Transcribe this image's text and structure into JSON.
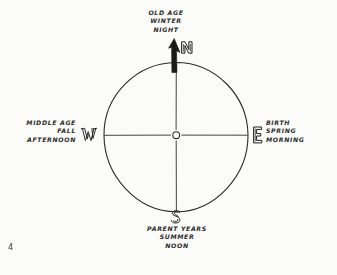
{
  "figure": {
    "kind": "hand-drawn medicine-wheel compass diagram",
    "page_number": "4",
    "center_marker": "small open circle at axes intersection",
    "north_arrow": "solid black arrowhead pointing up (north)",
    "background_color": "#fbfbf9",
    "ink_color": "#2b2b2b"
  },
  "directions": {
    "north": {
      "letter": "N",
      "lines": [
        "OLD AGE",
        "WINTER",
        "NIGHT"
      ]
    },
    "east": {
      "letter": "E",
      "lines": [
        "BIRTH",
        "SPRING",
        "MORNING"
      ]
    },
    "south": {
      "letter": "S",
      "lines": [
        "PARENT YEARS",
        "SUMMER",
        "NOON"
      ]
    },
    "west": {
      "letter": "W",
      "lines": [
        "MIDDLE AGE",
        "FALL",
        "AFTERNOON"
      ]
    }
  }
}
